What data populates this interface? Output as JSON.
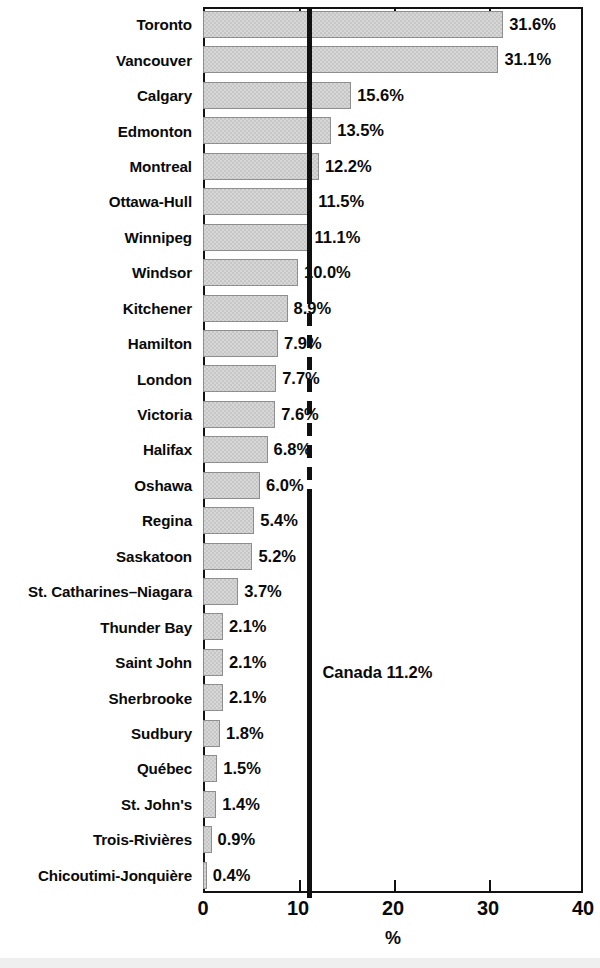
{
  "chart_data": {
    "type": "bar",
    "orientation": "horizontal",
    "title": "",
    "subtitle": "",
    "xlabel": "%",
    "ylabel": "",
    "xlim": [
      0,
      40
    ],
    "xticks": [
      0,
      10,
      20,
      30,
      40
    ],
    "xtick_labels": [
      "0",
      "10",
      "20",
      "30",
      "40"
    ],
    "grid": false,
    "legend": null,
    "categories": [
      "Toronto",
      "Vancouver",
      "Calgary",
      "Edmonton",
      "Montreal",
      "Ottawa-Hull",
      "Winnipeg",
      "Windsor",
      "Kitchener",
      "Hamilton",
      "London",
      "Victoria",
      "Halifax",
      "Oshawa",
      "Regina",
      "Saskatoon",
      "St. Catharines–Niagara",
      "Thunder Bay",
      "Saint John",
      "Sherbrooke",
      "Sudbury",
      "Québec",
      "St. John's",
      "Trois-Rivières",
      "Chicoutimi-Jonquière"
    ],
    "values": [
      31.6,
      31.1,
      15.6,
      13.5,
      12.2,
      11.5,
      11.1,
      10.0,
      8.9,
      7.9,
      7.7,
      7.6,
      6.8,
      6.0,
      5.4,
      5.2,
      3.7,
      2.1,
      2.1,
      2.1,
      1.8,
      1.5,
      1.4,
      0.9,
      0.4
    ],
    "value_labels": [
      "31.6%",
      "31.1%",
      "15.6%",
      "13.5%",
      "12.2%",
      "11.5%",
      "11.1%",
      "10.0%",
      "8.9%",
      "7.9%",
      "7.7%",
      "7.6%",
      "6.8%",
      "6.0%",
      "5.4%",
      "5.2%",
      "3.7%",
      "2.1%",
      "2.1%",
      "2.1%",
      "1.8%",
      "1.5%",
      "1.4%",
      "0.9%",
      "0.4%"
    ],
    "reference_line": {
      "label": "Canada 11.2%",
      "value": 11.2,
      "color": "#101010"
    },
    "colors": {
      "bar_fill": "#c6c6c6",
      "bar_edge": "#8e8e8e",
      "axis": "#121212",
      "text": "#0a0a0a"
    }
  }
}
